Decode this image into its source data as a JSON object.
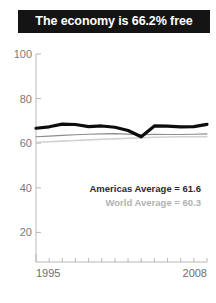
{
  "title": {
    "text": "The economy is 66.2% free"
  },
  "legend": {
    "americas": "Americas Average = 61.6",
    "world": "World Average = 60.3"
  },
  "axis": {
    "y_ticks": [
      "100",
      "80",
      "60",
      "40",
      "20"
    ],
    "x_start": "1995",
    "x_end": "2008"
  },
  "colors": {
    "banner_bg": "#141414",
    "banner_text": "#ffffff",
    "country_line": "#0d0d0d",
    "americas_line": "#8c8c8c",
    "world_line": "#d2d2d2",
    "axis": "#b8b8b8",
    "tick_text": "#7a7a7a"
  },
  "chart_data": {
    "type": "line",
    "title": "The economy is 66.2% free",
    "xlabel": "",
    "ylabel": "",
    "xlim": [
      1995,
      2008
    ],
    "ylim": [
      0,
      100
    ],
    "yticks": [
      20,
      40,
      60,
      80,
      100
    ],
    "xticks": [
      1995,
      1996,
      1997,
      1998,
      1999,
      2000,
      2001,
      2002,
      2003,
      2004,
      2005,
      2006,
      2007,
      2008
    ],
    "xtick_labels_shown": [
      "1995",
      "2008"
    ],
    "grid": false,
    "legend_position": "inside-lower-right",
    "x": [
      1995,
      1996,
      1997,
      1998,
      1999,
      2000,
      2001,
      2002,
      2003,
      2004,
      2005,
      2006,
      2007,
      2008
    ],
    "series": [
      {
        "name": "Country",
        "color": "#0d0d0d",
        "width": 3.2,
        "values": [
          64.3,
          65.0,
          66.3,
          66.1,
          65.1,
          65.4,
          64.8,
          63.2,
          60.2,
          65.4,
          65.3,
          65.0,
          65.1,
          66.2
        ]
      },
      {
        "name": "Americas Average",
        "color": "#8c8c8c",
        "width": 1.1,
        "values": [
          60.2,
          60.5,
          60.9,
          61.2,
          61.4,
          61.6,
          61.7,
          61.5,
          61.1,
          61.4,
          61.3,
          61.3,
          61.4,
          61.6
        ]
      },
      {
        "name": "World Average",
        "color": "#d2d2d2",
        "width": 1.6,
        "values": [
          57.6,
          57.8,
          58.1,
          58.4,
          58.7,
          59.0,
          59.2,
          59.5,
          59.7,
          60.0,
          60.1,
          60.2,
          60.2,
          60.3
        ]
      }
    ],
    "annotations": [
      {
        "text": "Americas Average = 61.6",
        "color": "#2b2b2b"
      },
      {
        "text": "World Average = 60.3",
        "color": "#b2b2b2"
      }
    ]
  },
  "geometry": {
    "plot_left": 36,
    "plot_right": 207,
    "y_top_px": 54,
    "y_bottom_px": 262,
    "y_top_val": 100,
    "y_bottom_val": 0
  }
}
